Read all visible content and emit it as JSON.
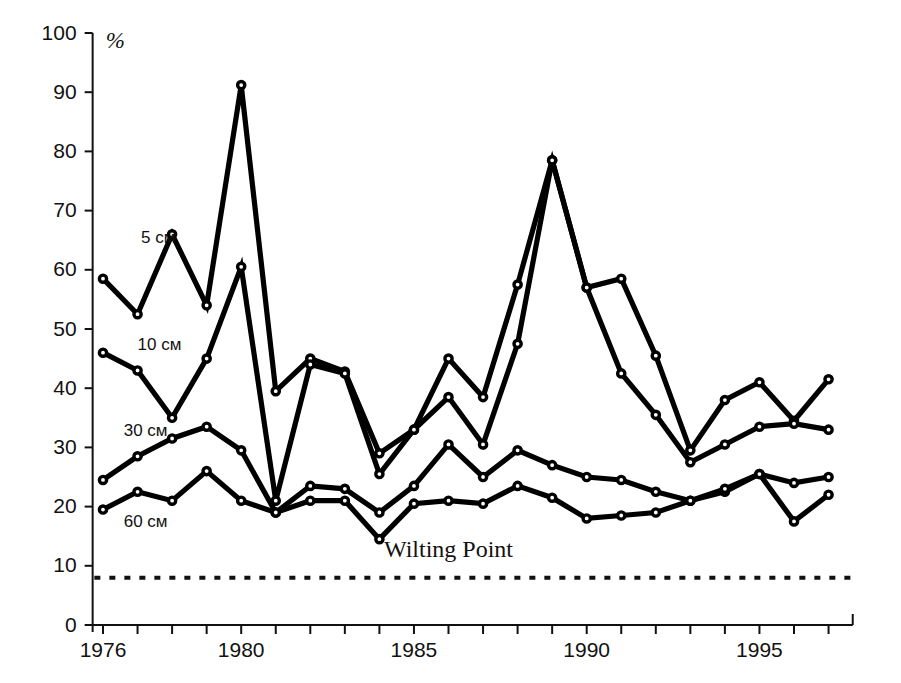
{
  "chart_data": {
    "type": "line",
    "title": "",
    "xlabel": "",
    "ylabel": "",
    "y_unit": "%",
    "xlim": [
      1975.7,
      1997.7
    ],
    "ylim": [
      0,
      100
    ],
    "grid": false,
    "legend_position": "inline-labels",
    "y_ticks": [
      0,
      10,
      20,
      30,
      40,
      50,
      60,
      70,
      80,
      90,
      100
    ],
    "x_ticks_labeled": [
      1976,
      1980,
      1985,
      1990,
      1995
    ],
    "x_ticks_all": [
      1976,
      1977,
      1978,
      1979,
      1980,
      1981,
      1982,
      1983,
      1984,
      1985,
      1986,
      1987,
      1988,
      1989,
      1990,
      1991,
      1992,
      1993,
      1994,
      1995,
      1996,
      1997
    ],
    "x": [
      1976,
      1977,
      1978,
      1979,
      1980,
      1981,
      1982,
      1983,
      1984,
      1985,
      1986,
      1987,
      1988,
      1989,
      1990,
      1991,
      1992,
      1993,
      1994,
      1995,
      1996,
      1997
    ],
    "series": [
      {
        "name": "5 см",
        "label": "5 см",
        "label_x": 1977.1,
        "label_y": 64.5,
        "values": [
          58.5,
          52.5,
          66.0,
          54.0,
          91.2,
          39.5,
          45.0,
          42.8,
          29.0,
          33.0,
          38.5,
          30.5,
          47.5,
          78.5,
          57.0,
          58.5,
          45.5,
          29.5,
          38.0,
          41.0,
          34.5,
          41.5
        ]
      },
      {
        "name": "10 см",
        "label": "10 см",
        "label_x": 1977.0,
        "label_y": 46.5,
        "values": [
          46.0,
          43.0,
          35.0,
          45.0,
          60.5,
          21.0,
          44.0,
          42.5,
          25.5,
          33.0,
          45.0,
          38.5,
          57.5,
          78.5,
          57.0,
          42.5,
          35.5,
          27.5,
          30.5,
          33.5,
          34.0,
          33.0
        ]
      },
      {
        "name": "30 см",
        "label": "30 см",
        "label_x": 1976.6,
        "label_y": 32.0,
        "values": [
          24.5,
          28.5,
          31.5,
          33.5,
          29.5,
          19.0,
          23.5,
          23.0,
          19.0,
          23.5,
          30.5,
          25.0,
          29.5,
          27.0,
          25.0,
          24.5,
          22.5,
          21.0,
          22.5,
          25.5,
          24.0,
          25.0
        ]
      },
      {
        "name": "60 см",
        "label": "60 см",
        "label_x": 1976.6,
        "label_y": 16.5,
        "values": [
          19.5,
          22.5,
          21.0,
          26.0,
          21.0,
          19.0,
          21.0,
          21.0,
          14.5,
          20.5,
          21.0,
          20.5,
          23.5,
          21.5,
          18.0,
          18.5,
          19.0,
          21.0,
          23.0,
          25.5,
          17.5,
          22.0
        ]
      }
    ],
    "annotations": [
      {
        "name": "wilting-point",
        "text": "Wilting Point",
        "value": 8.0,
        "text_x": 1986.0,
        "text_y": 11.5,
        "style": "dotted-horizontal-line",
        "x_start": 1975.75,
        "x_end": 1997.7
      }
    ]
  }
}
